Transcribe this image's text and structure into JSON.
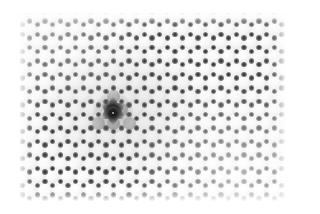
{
  "figure": {
    "kind": "scanning-probe-micrograph",
    "modality": "STM/AFM topography",
    "color_mode": "grayscale",
    "width_px": 305,
    "height_px": 214,
    "background_color": "#ffffff",
    "caption": "",
    "title": "",
    "scale_bar_text": "",
    "axis_labels": []
  },
  "scan_area": {
    "left_px": 20,
    "top_px": 13,
    "width_px": 265,
    "height_px": 188,
    "base_color": "#fbfbfb"
  },
  "lattice": {
    "symmetry": "hexagonal",
    "packing": "close-packed-rows",
    "columns": 18,
    "rows": 14,
    "spacing_x_px": 15.3,
    "spacing_y_px": 13.4,
    "row_offset_px": 7.65,
    "blob_diameter_px": 13.2,
    "blob_color_bright": "#fafafa",
    "blob_color_edge": "#cfcfcf",
    "blob_color_dimmed": "#b2b2b2",
    "junction_color": "#2b2b2b",
    "junction_diameter_px": 5.4,
    "junction_coordination": 3
  },
  "defect": {
    "label": "point-vacancy",
    "center_x_px": 113,
    "center_y_px": 113,
    "core_diameter_px": 13,
    "halo_diameter_px": 40,
    "star_points": 6,
    "star_radius_px": 9,
    "core_color": "#000000",
    "bright_center_color": "#e8e8e8",
    "neighbor_count": 6,
    "neighbor_state": "dimmed"
  },
  "rendering": {
    "illumination": "bright lower-right, soft gray depression at center-left",
    "vignette": "white feathered border",
    "noise_opacity": 0.05
  }
}
